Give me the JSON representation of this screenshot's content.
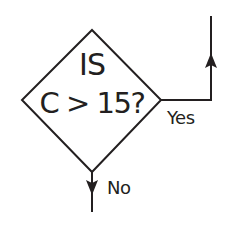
{
  "diagram": {
    "type": "flowchart-decision",
    "decision": {
      "shape": "diamond",
      "line1": "IS",
      "line2": "C > 15?"
    },
    "branches": [
      {
        "label": "Yes",
        "direction": "right-then-up"
      },
      {
        "label": "No",
        "direction": "down"
      }
    ],
    "colors": {
      "stroke": "#231f20",
      "text": "#231f20",
      "background": "#ffffff"
    }
  }
}
